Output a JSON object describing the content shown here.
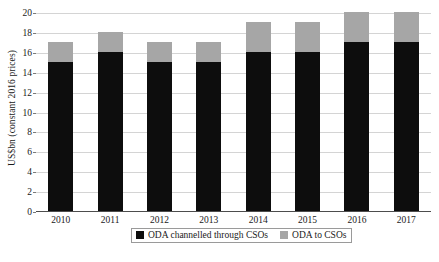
{
  "chart_data": {
    "type": "bar",
    "stacked": true,
    "title": "",
    "xlabel": "",
    "ylabel": "US$bn (constant 2016 prices)",
    "categories": [
      "2010",
      "2011",
      "2012",
      "2013",
      "2014",
      "2015",
      "2016",
      "2017"
    ],
    "series": [
      {
        "name": "ODA channelled through CSOs",
        "color": "#0d0d0d",
        "values": [
          15,
          16,
          15,
          15,
          16,
          16,
          17,
          17
        ]
      },
      {
        "name": "ODA to CSOs",
        "color": "#a6a6a6",
        "values": [
          2,
          2,
          2,
          2,
          3,
          3,
          3,
          3
        ]
      }
    ],
    "totals": [
      17,
      18,
      17,
      17,
      19,
      19,
      20,
      20
    ],
    "ylim": [
      0,
      20
    ],
    "yticks": [
      0,
      2,
      4,
      6,
      8,
      10,
      12,
      14,
      16,
      18,
      20
    ],
    "ytick_labels": [
      "0",
      "2",
      "4",
      "6",
      "8",
      "10",
      "12",
      "14",
      "16",
      "18",
      "20"
    ],
    "grid": true,
    "legend_position": "bottom"
  }
}
